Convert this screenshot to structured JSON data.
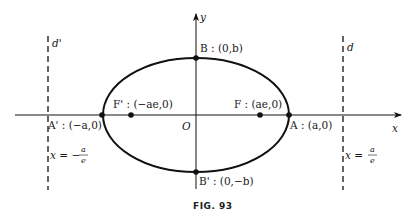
{
  "figure": {
    "caption": "FIG. 93"
  },
  "axes": {
    "x_label": "x",
    "y_label": "y",
    "origin_label": "O"
  },
  "ellipse": {
    "center": [
      196,
      115
    ],
    "semi_major_px": 93,
    "semi_minor_px": 57
  },
  "points": {
    "A": {
      "name": "A",
      "label": "A : (a,0)",
      "px": [
        289,
        115
      ]
    },
    "A_prime": {
      "name": "A'",
      "label": "A' : (−a,0)",
      "px": [
        102,
        115
      ]
    },
    "B": {
      "name": "B",
      "label": "B : (0,b)",
      "px": [
        196,
        58
      ]
    },
    "B_prime": {
      "name": "B'",
      "label": "B' : (0,−b)",
      "px": [
        196,
        172
      ]
    },
    "F": {
      "name": "F",
      "label": "F : (ae,0)",
      "px": [
        260,
        115
      ]
    },
    "F_prime": {
      "name": "F'",
      "label": "F' : (−ae,0)",
      "px": [
        131,
        115
      ]
    }
  },
  "directrices": {
    "left": {
      "name": "d'",
      "equation_lhs": "x = −",
      "num": "a",
      "den": "e",
      "x_px": 48
    },
    "right": {
      "name": "d",
      "equation_lhs": "x = ",
      "num": "a",
      "den": "e",
      "x_px": 343
    }
  },
  "colors": {
    "stroke": "#111111",
    "background": "#ffffff"
  }
}
